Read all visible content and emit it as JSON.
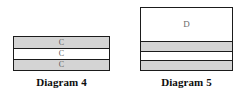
{
  "figures": [
    {
      "id": "diagram-4",
      "caption": "Diagram 4",
      "layers": [
        {
          "label": "C",
          "fill": "shaded",
          "height": 11
        },
        {
          "label": "C",
          "fill": "plain",
          "height": 11
        },
        {
          "label": "C",
          "fill": "shaded",
          "height": 11
        }
      ]
    },
    {
      "id": "diagram-5",
      "caption": "Diagram 5",
      "layers": [
        {
          "label": "D",
          "fill": "plain",
          "height": 33
        },
        {
          "label": "",
          "fill": "shaded",
          "height": 10
        },
        {
          "label": "",
          "fill": "plain",
          "height": 9
        },
        {
          "label": "",
          "fill": "shaded",
          "height": 10
        }
      ]
    }
  ],
  "colors": {
    "shaded_fill": "#d4d4d4",
    "plain_fill": "#ffffff",
    "outline": "#1b1b1b",
    "label_text": "#5e5e5e",
    "caption_text": "#0d0d0d",
    "background": "#ffffff"
  }
}
